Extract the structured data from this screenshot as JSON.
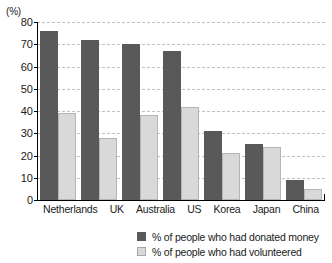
{
  "chart_data": {
    "type": "bar",
    "title": "",
    "xlabel": "",
    "ylabel": "(%)",
    "ylim": [
      0,
      80
    ],
    "yticks": [
      0,
      10,
      20,
      30,
      40,
      50,
      60,
      70,
      80
    ],
    "grid": true,
    "legend_position": "bottom",
    "categories": [
      "Netherlands",
      "UK",
      "Australia",
      "US",
      "Korea",
      "Japan",
      "China"
    ],
    "series": [
      {
        "name": "% of people who had donated money",
        "color": "#595959",
        "values": [
          76,
          72,
          70,
          67,
          31,
          25,
          9
        ]
      },
      {
        "name": "% of people who had volunteered",
        "color": "#d9d9d9",
        "values": [
          39,
          28,
          38,
          42,
          21,
          24,
          5
        ]
      }
    ]
  },
  "axis": {
    "unit_label": "(%)"
  }
}
